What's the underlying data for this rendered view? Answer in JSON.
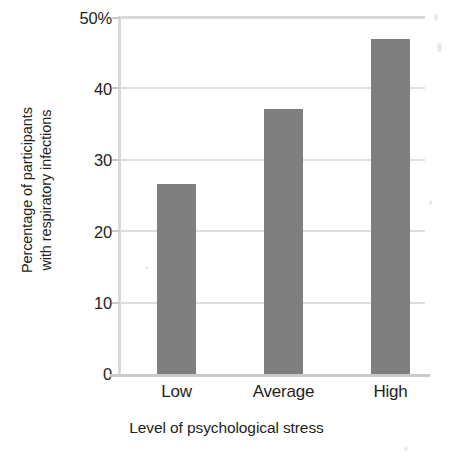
{
  "chart_data": {
    "type": "bar",
    "title": "",
    "subtitle": "",
    "xlabel": "Level of psychological stress",
    "ylabel": "Percentage of participants with respiratory infections",
    "ylabel_lines": [
      "Percentage of participants",
      "with respiratory infections"
    ],
    "categories": [
      "Low",
      "Average",
      "High"
    ],
    "values": [
      26.7,
      37.3,
      47.0
    ],
    "ylim": [
      0,
      50
    ],
    "ytick_values": [
      0,
      10,
      20,
      30,
      40,
      50
    ],
    "ytick_labels": [
      "0",
      "10",
      "20",
      "30",
      "40",
      "50%"
    ],
    "grid": true,
    "grid_axis": "y",
    "legend": "none",
    "series": [
      {
        "name": "Percentage with respiratory infections",
        "values": [
          26.7,
          37.3,
          47.0
        ]
      }
    ],
    "colors": {
      "bar_fill": "#807f80",
      "gridline": "#dedede",
      "axis_line": "#d9d9d9",
      "baseline": "#c9c9c9",
      "text": "#231f20",
      "background": "#ffffff"
    }
  }
}
